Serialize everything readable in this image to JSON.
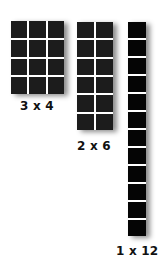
{
  "diagram": {
    "arrays": [
      {
        "id": "array-3x4",
        "label": "3 x 4",
        "columns": 3,
        "rows": 4,
        "cell_count": 12,
        "cell_color": "#1c1c1c"
      },
      {
        "id": "array-2x6",
        "label": "2 x 6",
        "columns": 2,
        "rows": 6,
        "cell_count": 12,
        "cell_color": "#1c1c1c"
      },
      {
        "id": "array-1x12",
        "label": "1 x 12",
        "columns": 1,
        "rows": 12,
        "cell_count": 12,
        "cell_color": "#050505"
      }
    ],
    "colors": {
      "background": "#ffffff",
      "grid_line": "#ffffff",
      "label_text": "#111111"
    }
  }
}
